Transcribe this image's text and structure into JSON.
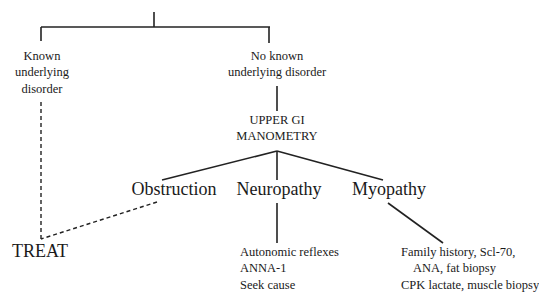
{
  "diagram": {
    "type": "flowchart",
    "nodes": {
      "known": {
        "lines": [
          "Known",
          "underlying",
          "disorder"
        ]
      },
      "no_known": {
        "lines": [
          "No known",
          "underlying disorder"
        ]
      },
      "manometry": {
        "lines": [
          "UPPER GI",
          "MANOMETRY"
        ]
      },
      "obstruction": {
        "label": "Obstruction"
      },
      "neuropathy": {
        "label": "Neuropathy"
      },
      "myopathy": {
        "label": "Myopathy"
      },
      "treat": {
        "label": "TREAT"
      },
      "neuropathy_workup": {
        "lines": [
          "Autonomic reflexes",
          "ANNA-1",
          "Seek cause"
        ]
      },
      "myopathy_workup": {
        "lines": [
          "Family history, Scl-70,",
          "ANA, fat biopsy",
          "CPK lactate, muscle biopsy"
        ]
      }
    },
    "edges": [
      {
        "from": "root",
        "to": "known",
        "style": "solid"
      },
      {
        "from": "root",
        "to": "no_known",
        "style": "solid"
      },
      {
        "from": "no_known",
        "to": "manometry",
        "style": "solid"
      },
      {
        "from": "manometry",
        "to": "obstruction",
        "style": "solid"
      },
      {
        "from": "manometry",
        "to": "neuropathy",
        "style": "solid"
      },
      {
        "from": "manometry",
        "to": "myopathy",
        "style": "solid"
      },
      {
        "from": "known",
        "to": "treat",
        "style": "dashed"
      },
      {
        "from": "obstruction",
        "to": "treat",
        "style": "dashed"
      },
      {
        "from": "neuropathy",
        "to": "neuropathy_workup",
        "style": "solid"
      },
      {
        "from": "myopathy",
        "to": "myopathy_workup",
        "style": "solid"
      }
    ],
    "line_color": "#222222"
  }
}
